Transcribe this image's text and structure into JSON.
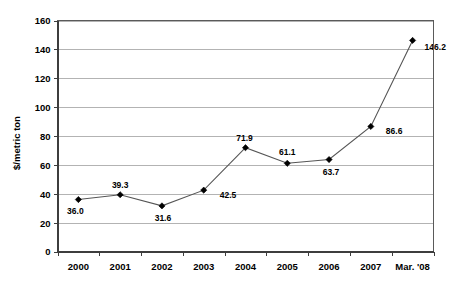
{
  "chart_data": {
    "type": "line",
    "title": "",
    "subtitle": "",
    "xlabel": "",
    "ylabel": "$/metric ton",
    "categories": [
      "2000",
      "2001",
      "2002",
      "2003",
      "2004",
      "2005",
      "2006",
      "2007",
      "Mar. '08"
    ],
    "values": [
      36.0,
      39.3,
      31.6,
      42.5,
      71.9,
      61.1,
      63.7,
      86.6,
      146.2
    ],
    "point_labels": [
      "36.0",
      "39.3",
      "31.6",
      "42.5",
      "71.9",
      "61.1",
      "63.7",
      "86.6",
      "146.2"
    ],
    "ylim": [
      0,
      160
    ],
    "ytick_values": [
      0,
      20,
      40,
      60,
      80,
      100,
      120,
      140,
      160
    ],
    "ytick_labels": [
      "0",
      "20",
      "40",
      "60",
      "80",
      "100",
      "120",
      "140",
      "160"
    ],
    "grid": true,
    "grid_axis": "y",
    "legend": false,
    "legend_position": "none",
    "marker": "diamond",
    "series": [
      {
        "name": "",
        "values": [
          36.0,
          39.3,
          31.6,
          42.5,
          71.9,
          61.1,
          63.7,
          86.6,
          146.2
        ]
      }
    ],
    "colors": {
      "line": "#555555",
      "marker": "#000000",
      "gridline": "#b3b3b3",
      "axis": "#3d3d3d",
      "plot_border": "#5a5a5a",
      "background": "#ffffff",
      "text": "#000000"
    },
    "label_offsets": [
      {
        "dx": -3,
        "dy": 14
      },
      {
        "dx": 0,
        "dy": -7
      },
      {
        "dx": 1,
        "dy": 15
      },
      {
        "dx": 16,
        "dy": 8
      },
      {
        "dx": -1,
        "dy": -7
      },
      {
        "dx": 0,
        "dy": -8
      },
      {
        "dx": 2,
        "dy": 15
      },
      {
        "dx": 15,
        "dy": 8
      },
      {
        "dx": 12,
        "dy": 10
      }
    ]
  }
}
